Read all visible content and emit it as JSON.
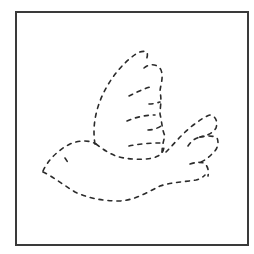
{
  "worksheet": {
    "subject": "dove",
    "caption": "Dashed-line dove tracing outline",
    "colors": {
      "background": "#ffffff",
      "frame": "#3a3a3a",
      "dashes": "#2b2b2b"
    },
    "parts": [
      "head",
      "eye",
      "body",
      "upper-wing",
      "wing-feather-lines",
      "tail"
    ]
  }
}
